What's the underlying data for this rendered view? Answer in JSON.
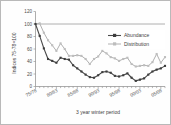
{
  "chart_data": {
    "type": "line",
    "title": "",
    "xlabel": "3 year winter period",
    "ylabel": "Indices 75-78=100",
    "ylim": [
      0,
      120
    ],
    "yticks": [
      0,
      20,
      40,
      60,
      80,
      100,
      120
    ],
    "grid": false,
    "reference_line": 100,
    "legend_position": "top-right",
    "x_tick_labels": [
      "75/78",
      "80/83",
      "85/88",
      "90/93",
      "95/98",
      "00/03",
      "05/08"
    ],
    "x_tick_label_indices": [
      0,
      5,
      10,
      15,
      20,
      25,
      30
    ],
    "x": [
      "75/78",
      "76/79",
      "77/80",
      "78/81",
      "79/82",
      "80/83",
      "81/84",
      "82/85",
      "83/86",
      "84/87",
      "85/88",
      "86/89",
      "87/90",
      "88/91",
      "89/92",
      "90/93",
      "91/94",
      "92/95",
      "93/96",
      "94/97",
      "95/98",
      "96/99",
      "97/00",
      "98/01",
      "99/02",
      "00/03",
      "01/04",
      "02/05",
      "03/06",
      "04/07",
      "05/08",
      "06/09"
    ],
    "series": [
      {
        "name": "Abundance",
        "color": "#4a4a4a",
        "marker": "square",
        "values": [
          100,
          81,
          61,
          44,
          41,
          38,
          46,
          44,
          43,
          34,
          29,
          24,
          19,
          15,
          14,
          18,
          23,
          24,
          22,
          17,
          16,
          18,
          21,
          14,
          9,
          11,
          13,
          19,
          24,
          27,
          29,
          33
        ]
      },
      {
        "name": "Distribution",
        "color": "#b0b0b0",
        "marker": "square",
        "values": [
          100,
          101,
          86,
          74,
          66,
          57,
          69,
          60,
          49,
          49,
          50,
          49,
          44,
          36,
          44,
          48,
          57,
          53,
          47,
          45,
          41,
          44,
          46,
          36,
          32,
          33,
          34,
          33,
          39,
          52,
          38,
          47
        ]
      }
    ]
  },
  "legend": {
    "items": [
      {
        "label": "Abundance"
      },
      {
        "label": "Distribution"
      }
    ]
  },
  "axes": {
    "y_title": "Indices 75-78=100",
    "x_title": "3 year winter period"
  }
}
